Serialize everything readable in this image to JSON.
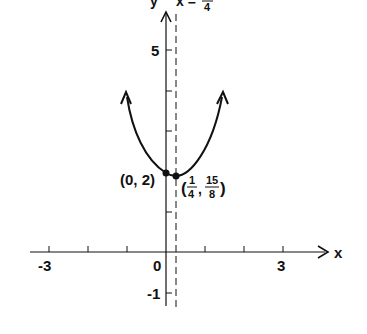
{
  "figure": {
    "type": "function-graph",
    "axes": {
      "x_label": "x",
      "y_label": "y",
      "x_ticks": [
        "-3",
        "0",
        "3"
      ],
      "y_ticks": [
        "5",
        "-1"
      ]
    },
    "asymptote_label": {
      "lhs": "x =",
      "num": "1",
      "den": "4"
    },
    "points": [
      {
        "label": "(0, 2)",
        "x": 0,
        "y": 2
      },
      {
        "label_open": "(",
        "x_num": "1",
        "x_den": "4",
        "sep": ",",
        "y_num": "15",
        "y_den": "8",
        "label_close": ")",
        "x": 0.25,
        "y": 1.875
      }
    ],
    "colors": {
      "ink": "#111111",
      "background": "#ffffff"
    }
  }
}
